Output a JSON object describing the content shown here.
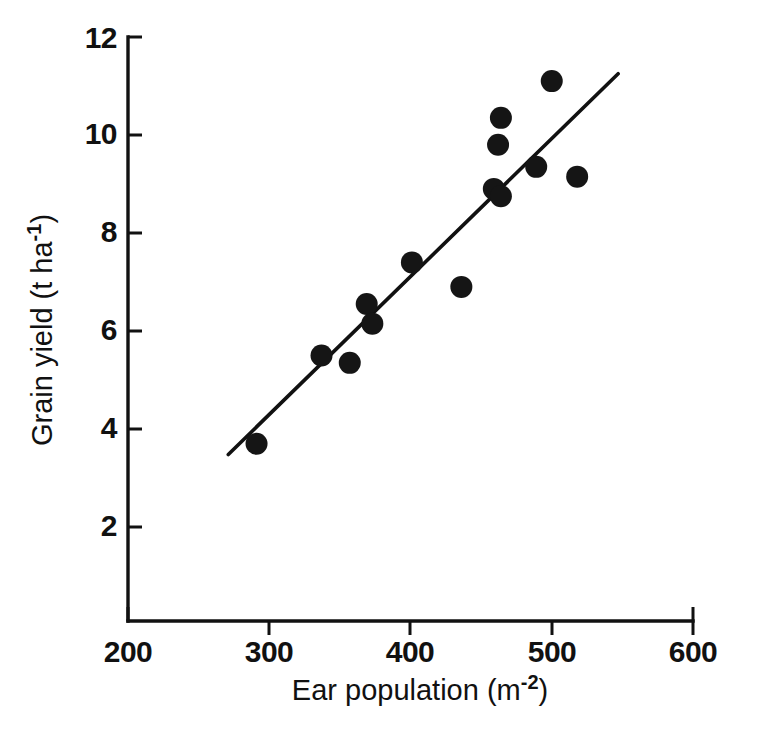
{
  "chart_data": {
    "type": "scatter",
    "title": "",
    "xlabel": "Ear population (m-2)",
    "xlabel_base": "Ear population (m",
    "xlabel_exponent": "-2",
    "xlabel_close": ")",
    "ylabel": "Grain yield (t ha-1)",
    "ylabel_base": "Grain yield (t ha",
    "ylabel_exponent": "-1",
    "ylabel_close": ")",
    "xlim": [
      200,
      600
    ],
    "ylim": [
      0,
      12
    ],
    "xticks": [
      200,
      300,
      400,
      500,
      600
    ],
    "yticks": [
      2,
      4,
      6,
      8,
      10,
      12
    ],
    "xtick_labels": [
      "200",
      "300",
      "400",
      "500",
      "600"
    ],
    "ytick_labels": [
      "2",
      "4",
      "6",
      "8",
      "10",
      "12"
    ],
    "grid": false,
    "legend": false,
    "marker_color": "#151515",
    "line_color": "#111111",
    "axis_color": "#111111",
    "background": "#ffffff",
    "points": [
      {
        "x": 291,
        "y": 3.7
      },
      {
        "x": 337,
        "y": 5.5
      },
      {
        "x": 357,
        "y": 5.35
      },
      {
        "x": 369,
        "y": 6.55
      },
      {
        "x": 373,
        "y": 6.15
      },
      {
        "x": 401,
        "y": 7.4
      },
      {
        "x": 436,
        "y": 6.9
      },
      {
        "x": 459,
        "y": 8.9
      },
      {
        "x": 464,
        "y": 8.75
      },
      {
        "x": 462,
        "y": 9.8
      },
      {
        "x": 464,
        "y": 10.35
      },
      {
        "x": 489,
        "y": 9.35
      },
      {
        "x": 500,
        "y": 11.1
      },
      {
        "x": 518,
        "y": 9.15
      }
    ],
    "fit_line": {
      "label": "regression line",
      "x_start": 271,
      "y_start": 3.48,
      "x_end": 547,
      "y_end": 11.25
    }
  },
  "figure": {
    "marker_radius_px": 11,
    "tick_length_px": 14
  }
}
